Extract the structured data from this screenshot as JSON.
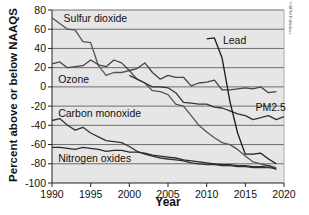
{
  "chart_data": {
    "type": "line",
    "title": "",
    "xlabel": "Year",
    "ylabel": "Percent above or below NAAQS",
    "xlim": [
      1990,
      2020
    ],
    "ylim": [
      -100,
      80
    ],
    "x_ticks": [
      "1990",
      "1995",
      "2000",
      "2005",
      "2010",
      "2015",
      "2020"
    ],
    "y_ticks": [
      "80",
      "60",
      "40",
      "20",
      "0",
      "-20",
      "-40",
      "-60",
      "-80",
      "-100"
    ],
    "grid": "horizontal",
    "legend": "inline labels",
    "annotation": "© BPW Publishers",
    "series": [
      {
        "name": "Sulfur dioxide",
        "label_pos": [
          1991.5,
          72
        ],
        "x": [
          1990,
          1991,
          1992,
          1993,
          1994,
          1995,
          1996,
          1997,
          1998,
          1999,
          2000,
          2001,
          2002,
          2003,
          2004,
          2005,
          2006,
          2007,
          2008,
          2009,
          2010,
          2011,
          2012,
          2013,
          2014,
          2015,
          2016,
          2017,
          2018,
          2019
        ],
        "values": [
          72,
          66,
          60,
          59,
          47,
          46,
          22,
          12,
          15,
          15,
          17,
          8,
          4,
          -4,
          -5,
          -8,
          -18,
          -20,
          -30,
          -40,
          -47,
          -53,
          -58,
          -60,
          -65,
          -72,
          -78,
          -80,
          -82,
          -84
        ],
        "color": "#555555"
      },
      {
        "name": "Ozone",
        "label_pos": [
          1990.8,
          8
        ],
        "x": [
          1990,
          1991,
          1992,
          1993,
          1994,
          1995,
          1996,
          1997,
          1998,
          1999,
          2000,
          2001,
          2002,
          2003,
          2004,
          2005,
          2006,
          2007,
          2008,
          2009,
          2010,
          2011,
          2012,
          2013,
          2014,
          2015,
          2016,
          2017,
          2018,
          2019
        ],
        "values": [
          24,
          26,
          20,
          21,
          22,
          28,
          23,
          21,
          28,
          25,
          17,
          19,
          25,
          15,
          8,
          12,
          10,
          10,
          1,
          4,
          5,
          7,
          -3,
          -3,
          -2,
          -1,
          -2,
          0,
          -6,
          -5
        ],
        "color": "#444444"
      },
      {
        "name": "PM2.5",
        "label_pos": [
          2016.3,
          -21
        ],
        "x": [
          2000,
          2001,
          2002,
          2003,
          2004,
          2005,
          2006,
          2007,
          2008,
          2009,
          2010,
          2011,
          2012,
          2013,
          2014,
          2015,
          2016,
          2017,
          2018,
          2019,
          2020
        ],
        "values": [
          12,
          8,
          4,
          0,
          0,
          -1,
          -6,
          -16,
          -17,
          -18,
          -18,
          -21,
          -22,
          -25,
          -28,
          -30,
          -34,
          -32,
          -30,
          -34,
          -31
        ],
        "color": "#333333"
      },
      {
        "name": "Lead",
        "label_pos": [
          2012.1,
          49
        ],
        "x": [
          2010,
          2011,
          2012,
          2013,
          2014,
          2015,
          2016,
          2017,
          2018,
          2019
        ],
        "values": [
          50,
          51,
          30,
          -15,
          -48,
          -70,
          -70,
          -69,
          -75,
          -80
        ],
        "color": "#1a1a1a"
      },
      {
        "name": "Carbon monoxide",
        "label_pos": [
          1990.8,
          -27
        ],
        "x": [
          1990,
          1991,
          1992,
          1993,
          1994,
          1995,
          1996,
          1997,
          1998,
          1999,
          2000,
          2001,
          2002,
          2003,
          2004,
          2005,
          2006,
          2007,
          2008,
          2009,
          2010,
          2011,
          2012,
          2013,
          2014,
          2015,
          2016,
          2017,
          2018,
          2019
        ],
        "values": [
          -35,
          -33,
          -40,
          -45,
          -42,
          -48,
          -52,
          -56,
          -57,
          -58,
          -62,
          -67,
          -70,
          -72,
          -74,
          -75,
          -76,
          -77,
          -79,
          -80,
          -81,
          -81,
          -82,
          -82,
          -83,
          -83,
          -84,
          -84,
          -84,
          -85
        ],
        "color": "#333333"
      },
      {
        "name": "Nitrogen oxides",
        "label_pos": [
          1990.8,
          -74
        ],
        "x": [
          1990,
          1991,
          1992,
          1993,
          1994,
          1995,
          1996,
          1997,
          1998,
          1999,
          2000,
          2001,
          2002,
          2003,
          2004,
          2005,
          2006,
          2007,
          2008,
          2009,
          2010,
          2011,
          2012,
          2013,
          2014,
          2015,
          2016,
          2017,
          2018,
          2019
        ],
        "values": [
          -63,
          -63,
          -64,
          -65,
          -63,
          -64,
          -65,
          -67,
          -66,
          -66,
          -68,
          -68,
          -69,
          -71,
          -72,
          -73,
          -74,
          -76,
          -77,
          -78,
          -79,
          -80,
          -81,
          -81,
          -82,
          -82,
          -83,
          -83,
          -82,
          -86
        ],
        "color": "#2a2a2a"
      }
    ]
  },
  "colors": {
    "plot_background": "#e6e6e6",
    "gridline": "#6e6e6e",
    "axis": "#222222",
    "text": "#111111"
  }
}
